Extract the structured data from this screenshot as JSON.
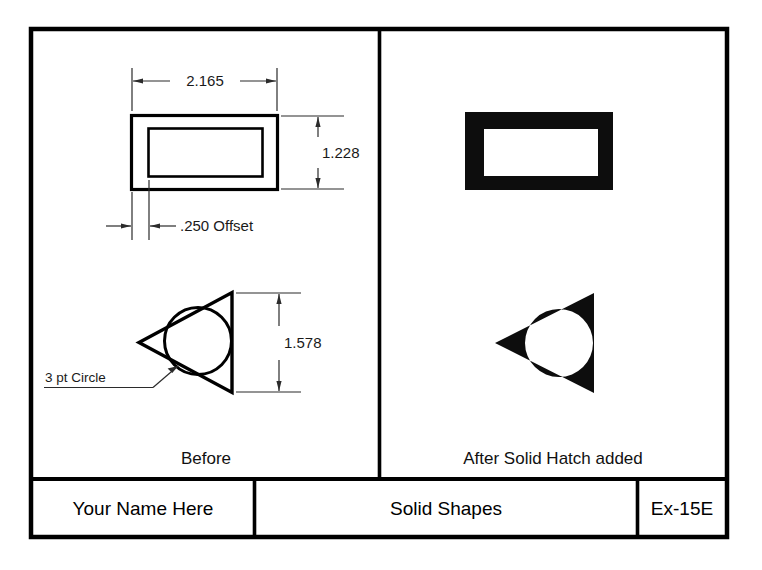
{
  "sheet": {
    "width": 762,
    "height": 570,
    "background": "#ffffff",
    "ink": "#000000",
    "thin_ink": "#2b2b2b",
    "fill_color": "#0d0d0d"
  },
  "panels": {
    "left": {
      "label": "Before",
      "dimensions": [
        {
          "name": "rectangle-width",
          "value": "2.165",
          "orientation": "horizontal"
        },
        {
          "name": "rectangle-height",
          "value": "1.228",
          "orientation": "vertical"
        },
        {
          "name": "offset",
          "value": ".250 Offset",
          "orientation": "horizontal"
        },
        {
          "name": "triangle-height",
          "value": "1.578",
          "orientation": "vertical"
        }
      ],
      "leaders": [
        {
          "name": "circle-note",
          "text": "3 pt Circle"
        }
      ],
      "shapes": [
        {
          "name": "outlined-rectangle-with-offset-inner",
          "type": "rectangle-outline"
        },
        {
          "name": "outlined-triangle-with-circle",
          "type": "triangle-circle-outline"
        }
      ]
    },
    "right": {
      "label": "After Solid Hatch added",
      "shapes": [
        {
          "name": "solid-filled-rectangle",
          "type": "rectangle-solid"
        },
        {
          "name": "solid-filled-triangle-with-circle",
          "type": "triangle-circle-solid"
        }
      ]
    }
  },
  "title_block": {
    "name_cell": "Your Name Here",
    "title_cell": "Solid Shapes",
    "number_cell": "Ex-15E"
  }
}
